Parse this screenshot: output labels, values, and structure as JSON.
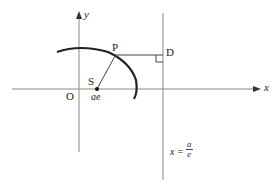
{
  "diagram": {
    "type": "ellipse-directrix-focus",
    "labels": {
      "y_axis": "y",
      "x_axis": "x",
      "origin": "O",
      "point_p": "P",
      "point_d": "D",
      "focus": "S",
      "focus_coord": "ae",
      "directrix_prefix": "x =",
      "directrix_num": "a",
      "directrix_den": "e"
    },
    "colors": {
      "axis": "#888888",
      "curve": "#222222",
      "line": "#444444",
      "text": "#222222"
    }
  }
}
